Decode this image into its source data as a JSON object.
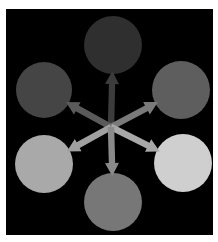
{
  "diagram": {
    "background": "#000000",
    "hub": {
      "x": 111,
      "y": 127
    },
    "nodes": [
      {
        "id": "top",
        "cx": 113,
        "cy": 45,
        "r": 29,
        "fill": "#2f2f2f",
        "arrow_color": "#3c3c3c"
      },
      {
        "id": "upper-left",
        "cx": 44,
        "cy": 90,
        "r": 28,
        "fill": "#454545",
        "arrow_color": "#5a5a5a"
      },
      {
        "id": "upper-right",
        "cx": 181,
        "cy": 90,
        "r": 29,
        "fill": "#5e5e5e",
        "arrow_color": "#7a7a7a"
      },
      {
        "id": "lower-left",
        "cx": 44,
        "cy": 164,
        "r": 29,
        "fill": "#a9a9a9",
        "arrow_color": "#a0a0a0"
      },
      {
        "id": "lower-right",
        "cx": 183,
        "cy": 163,
        "r": 29,
        "fill": "#cfcfcf",
        "arrow_color": "#a8a8a8"
      },
      {
        "id": "bottom",
        "cx": 113,
        "cy": 202,
        "r": 29,
        "fill": "#777777",
        "arrow_color": "#8a8a8a"
      }
    ]
  }
}
